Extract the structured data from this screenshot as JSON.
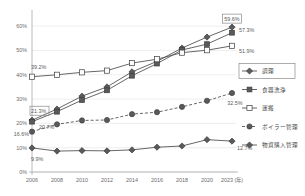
{
  "chart_data": {
    "type": "line",
    "title": "",
    "xlabel": "年",
    "ylabel": "",
    "ylim": [
      0,
      65
    ],
    "ytick_labels": [
      "0%",
      "10%",
      "20%",
      "30%",
      "40%",
      "50%",
      "60%"
    ],
    "ytick_values": [
      0,
      10,
      20,
      30,
      40,
      50,
      60
    ],
    "grid": true,
    "legend_position": "right",
    "categories": [
      "2006",
      "2008",
      "2010",
      "2012",
      "2014",
      "2016",
      "2018",
      "2020",
      "2023"
    ],
    "xtick_labels": [
      "2006",
      "2008",
      "2010",
      "2012",
      "2014",
      "2016",
      "2018",
      "2020",
      "2023"
    ],
    "x_axis_unit": "(年)",
    "series": [
      {
        "name": "調理",
        "marker": "diamond-filled",
        "linestyle": "solid",
        "values": [
          21.3,
          25.9,
          31.2,
          35.0,
          41.2,
          45.5,
          51.0,
          55.5,
          59.6
        ]
      },
      {
        "name": "食器洗浄",
        "marker": "square-filled",
        "linestyle": "solid",
        "values": [
          20.7,
          24.8,
          29.6,
          33.6,
          39.6,
          44.6,
          50.2,
          52.6,
          57.3
        ]
      },
      {
        "name": "運搬",
        "marker": "square-open",
        "linestyle": "solid",
        "values": [
          39.2,
          40.0,
          41.0,
          41.7,
          44.8,
          46.4,
          49.1,
          50.1,
          51.9
        ]
      },
      {
        "name": "ボイラー管理",
        "marker": "circle-filled",
        "linestyle": "dashed",
        "values": [
          16.6,
          19.6,
          21.2,
          21.4,
          23.8,
          24.6,
          26.8,
          29.3,
          32.5
        ]
      },
      {
        "name": "物資購入管理",
        "marker": "diamond-filled",
        "linestyle": "solid",
        "values": [
          9.9,
          8.6,
          8.8,
          8.7,
          9.1,
          10.2,
          10.7,
          13.3,
          12.7
        ]
      }
    ],
    "annotations": [
      {
        "text": "39.2%",
        "series": "運搬",
        "point_index": 0,
        "boxed": false
      },
      {
        "text": "21.3%",
        "series": "調理",
        "point_index": 0,
        "boxed": true
      },
      {
        "text": "20.7%",
        "series": "食器洗浄",
        "point_index": 0,
        "boxed": false
      },
      {
        "text": "16.6%",
        "series": "ボイラー管理",
        "point_index": 0,
        "boxed": false
      },
      {
        "text": "9.9%",
        "series": "物資購入管理",
        "point_index": 0,
        "boxed": false
      },
      {
        "text": "59.6%",
        "series": "調理",
        "point_index": 8,
        "boxed": true
      },
      {
        "text": "57.3%",
        "series": "食器洗浄",
        "point_index": 8,
        "boxed": false
      },
      {
        "text": "51.9%",
        "series": "運搬",
        "point_index": 8,
        "boxed": false
      },
      {
        "text": "32.5%",
        "series": "ボイラー管理",
        "point_index": 8,
        "boxed": false
      },
      {
        "text": "12.7%",
        "series": "物資購入管理",
        "point_index": 8,
        "boxed": false
      }
    ],
    "legend": [
      {
        "label": "調理",
        "marker": "diamond-filled",
        "linestyle": "solid",
        "boxed": true
      },
      {
        "label": "食器洗浄",
        "marker": "square-filled",
        "linestyle": "solid",
        "boxed": false
      },
      {
        "label": "運搬",
        "marker": "square-open",
        "linestyle": "solid",
        "boxed": false
      },
      {
        "label": "ボイラー管理",
        "marker": "circle-filled",
        "linestyle": "dashed",
        "boxed": false
      },
      {
        "label": "物資購入管理",
        "marker": "diamond-filled",
        "linestyle": "solid",
        "boxed": false
      }
    ],
    "colors": {
      "line": "#555555",
      "marker_fill": "#5a5a5a",
      "marker_open": "#ffffff",
      "grid": "#e3e3e3",
      "axis": "#a8a8a8",
      "text": "#5a5a5a"
    }
  }
}
